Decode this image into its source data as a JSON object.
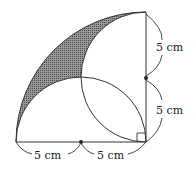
{
  "diagram": {
    "type": "geometry",
    "labels": {
      "right_upper": "5 cm",
      "right_lower": "5 cm",
      "bottom_left": "5 cm",
      "bottom_right": "5 cm"
    },
    "colors": {
      "stroke": "#333333",
      "shade": "#555555",
      "background": "#ffffff"
    }
  }
}
